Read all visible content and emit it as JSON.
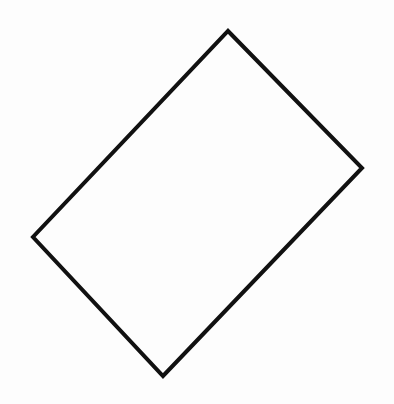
{
  "diagram": {
    "type": "quadrilateral",
    "shape": "rotated-rectangle",
    "background": "#fdfdfd",
    "stroke_color": "#111111",
    "stroke_width": 4,
    "fill": "none",
    "vertices": {
      "top": [
        228,
        31
      ],
      "right": [
        362,
        168
      ],
      "bottom": [
        163,
        376
      ],
      "left": [
        33,
        237
      ]
    },
    "points": "228,31 362,168 163,376 33,237"
  }
}
